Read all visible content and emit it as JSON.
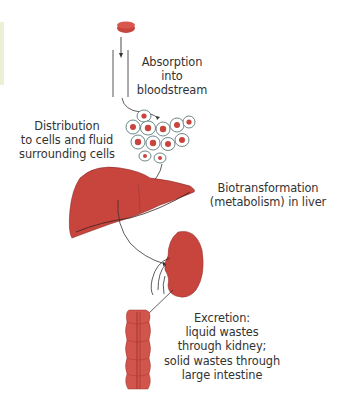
{
  "diagram": {
    "stages": [
      {
        "id": "absorption",
        "lines": [
          "Absorption",
          "into",
          "bloodstream"
        ]
      },
      {
        "id": "distribution",
        "lines": [
          "Distribution",
          "to cells and fluid",
          "surrounding cells"
        ]
      },
      {
        "id": "biotransformation",
        "lines": [
          "Biotransformation",
          "(metabolism) in liver"
        ]
      },
      {
        "id": "excretion",
        "lines": [
          "Excretion:",
          "liquid wastes",
          "through kidney;",
          "solid wastes through",
          "large intestine"
        ]
      }
    ],
    "icons": [
      "pill-icon",
      "blood-vessel-icon",
      "cells-icon",
      "liver-icon",
      "kidney-icon",
      "large-intestine-icon"
    ],
    "colors": {
      "organ": "#c8453e",
      "organ_dark": "#a8322c",
      "outline": "#3a3a3a",
      "cell_nucleus": "#c8453e",
      "cell_outline": "#4a6a6a",
      "side_strip": "#eef0d6"
    }
  }
}
